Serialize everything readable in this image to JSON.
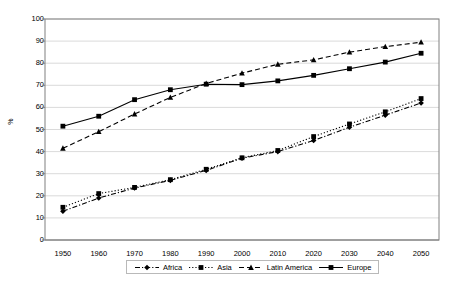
{
  "chart_data": {
    "type": "line",
    "title": "",
    "xlabel": "",
    "ylabel": "%",
    "ylim": [
      0,
      100
    ],
    "ytick_step": 10,
    "grid": true,
    "legend_position": "bottom",
    "categories": [
      "1950",
      "1960",
      "1970",
      "1980",
      "1990",
      "2000",
      "2010",
      "2020",
      "2030",
      "2040",
      "2050"
    ],
    "yticks": [
      "0",
      "10",
      "20",
      "30",
      "40",
      "50",
      "60",
      "70",
      "80",
      "90",
      "100"
    ],
    "series": [
      {
        "name": "Africa",
        "marker": "diamond",
        "line_style": "dash-dot",
        "color": "#000000",
        "values": [
          13.0,
          19.0,
          23.5,
          27.0,
          31.5,
          37.0,
          40.0,
          45.0,
          51.0,
          56.5,
          62.0
        ]
      },
      {
        "name": "Asia",
        "marker": "square",
        "line_style": "dotted",
        "color": "#000000",
        "values": [
          14.8,
          21.0,
          23.8,
          27.3,
          32.0,
          37.2,
          40.5,
          46.8,
          52.5,
          58.0,
          64.0
        ]
      },
      {
        "name": "Latin America",
        "marker": "triangle",
        "line_style": "dashed",
        "color": "#000000",
        "values": [
          41.5,
          49.0,
          57.0,
          64.5,
          70.8,
          75.5,
          79.5,
          81.5,
          85.0,
          87.5,
          89.5
        ]
      },
      {
        "name": "Europe",
        "marker": "square",
        "line_style": "solid",
        "color": "#000000",
        "values": [
          51.5,
          56.0,
          63.5,
          68.0,
          70.5,
          70.3,
          72.0,
          74.5,
          77.5,
          80.5,
          84.5
        ]
      }
    ]
  },
  "legend": {
    "items": [
      {
        "label": "Africa"
      },
      {
        "label": "Asia"
      },
      {
        "label": "Latin America"
      },
      {
        "label": "Europe"
      }
    ]
  }
}
